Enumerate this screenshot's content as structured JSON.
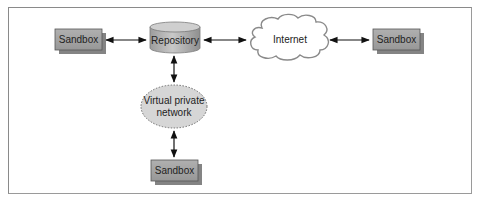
{
  "diagram": {
    "nodes": [
      {
        "id": "sandbox_left",
        "type": "box",
        "label": "Sandbox"
      },
      {
        "id": "repository",
        "type": "cylinder",
        "label": "Repository"
      },
      {
        "id": "internet",
        "type": "cloud",
        "label": "Internet"
      },
      {
        "id": "sandbox_right",
        "type": "box",
        "label": "Sandbox"
      },
      {
        "id": "vpn",
        "type": "ellipse",
        "label_line1": "Virtual private",
        "label_line2": "network"
      },
      {
        "id": "sandbox_bottom",
        "type": "box",
        "label": "Sandbox"
      }
    ],
    "edges": [
      {
        "from": "sandbox_left",
        "to": "repository",
        "direction": "bidirectional"
      },
      {
        "from": "repository",
        "to": "internet",
        "direction": "bidirectional"
      },
      {
        "from": "internet",
        "to": "sandbox_right",
        "direction": "bidirectional"
      },
      {
        "from": "repository",
        "to": "vpn",
        "direction": "bidirectional"
      },
      {
        "from": "vpn",
        "to": "sandbox_bottom",
        "direction": "bidirectional"
      }
    ],
    "colors": {
      "box_fill": "#a3a3a3",
      "box_shadow": "#6e6e6e",
      "cylinder_fill": "#b5b5b5",
      "cloud_fill": "#ffffff",
      "ellipse_fill": "#d6d6d6",
      "stroke": "#555555",
      "arrow": "#111111",
      "frame": "#8a8a8a"
    }
  }
}
